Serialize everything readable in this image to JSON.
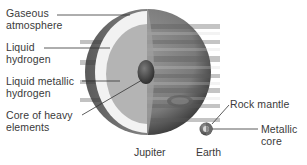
{
  "diagram": {
    "jupiter": {
      "caption": "Jupiter",
      "layers": [
        {
          "label_line1": "Gaseous",
          "label_line2": "atmosphere",
          "color": "#8c8c8c"
        },
        {
          "label_line1": "Liquid",
          "label_line2": "hydrogen",
          "color": "#f2f2f2"
        },
        {
          "label_line1": "Liquid metallic",
          "label_line2": "hydrogen",
          "color": "#b4b4b4"
        },
        {
          "label_line1": "Core of heavy",
          "label_line2": "elements",
          "color": "#4a4a4a"
        }
      ]
    },
    "earth": {
      "caption": "Earth",
      "layers": [
        {
          "label_line1": "Rock mantle",
          "label_line2": ""
        },
        {
          "label_line1": "Metallic",
          "label_line2": "core"
        }
      ]
    },
    "colors": {
      "text": "#3a3a3a",
      "leader_line": "#333333",
      "background": "#ffffff"
    }
  }
}
